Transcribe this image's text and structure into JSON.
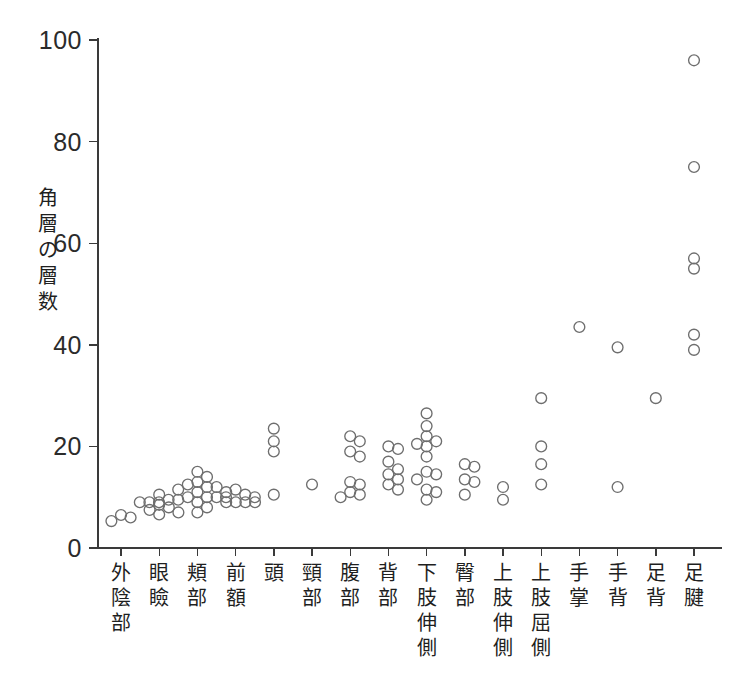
{
  "chart_data": {
    "type": "scatter",
    "title": "",
    "subtitle": "",
    "xlabel": "",
    "ylabel": "角層の層数",
    "ylim": [
      0,
      100
    ],
    "yticks": [
      0,
      20,
      40,
      60,
      80,
      100
    ],
    "grid": false,
    "legend": null,
    "legend_position": "none",
    "marker": "open-circle",
    "marker_color": "#6e6e6e",
    "categories": [
      "外陰部",
      "眼瞼",
      "頬部",
      "前額",
      "頭",
      "頸部",
      "腹部",
      "背部",
      "下肢伸側",
      "臀部",
      "上肢伸側",
      "上肢屈側",
      "手掌",
      "手背",
      "足背",
      "足腱"
    ],
    "series": [
      {
        "name": "角層の層数",
        "groups": [
          {
            "category": "外陰部",
            "values": [
              6.5,
              6.0,
              5.3
            ]
          },
          {
            "category": "眼瞼",
            "values": [
              10.5,
              8.5,
              8.0,
              7.5,
              7.0,
              6.6
            ]
          },
          {
            "category": "頬部",
            "values": [
              15.0,
              14.0,
              13.0,
              12.5,
              12.0,
              12.0,
              11.5,
              11.0,
              11.0,
              10.0,
              10.0,
              10.0,
              9.5,
              9.5,
              9.0,
              9.0,
              9.0,
              9.0,
              9.0,
              9.0,
              9.0,
              9.0,
              8.0,
              7.0
            ]
          },
          {
            "category": "前額",
            "values": [
              11.5,
              10.5,
              10.0,
              10.0
            ]
          },
          {
            "category": "頭",
            "values": [
              23.5,
              21.0,
              19.0,
              10.5
            ]
          },
          {
            "category": "頸部",
            "values": [
              12.5
            ]
          },
          {
            "category": "腹部",
            "values": [
              22.0,
              21.0,
              19.0,
              18.0,
              13.0,
              12.5,
              11.0,
              10.5,
              10.0
            ]
          },
          {
            "category": "背部",
            "values": [
              20.0,
              19.5,
              17.0,
              15.5,
              14.5,
              13.5,
              12.5,
              11.5
            ]
          },
          {
            "category": "下肢伸側",
            "values": [
              26.5,
              24.0,
              22.0,
              21.0,
              20.5,
              20.0,
              18.0,
              15.0,
              14.5,
              13.5,
              11.5,
              11.0,
              9.5
            ]
          },
          {
            "category": "臀部",
            "values": [
              16.5,
              16.0,
              13.5,
              13.0,
              10.5
            ]
          },
          {
            "category": "上肢伸側",
            "values": [
              12.0,
              9.5
            ]
          },
          {
            "category": "上肢屈側",
            "values": [
              29.5,
              20.0,
              16.5,
              12.5
            ]
          },
          {
            "category": "手掌",
            "values": [
              43.5
            ]
          },
          {
            "category": "手背",
            "values": [
              39.5,
              12.0
            ]
          },
          {
            "category": "足背",
            "values": [
              29.5
            ]
          },
          {
            "category": "足腱",
            "values": [
              96.0,
              75.0,
              57.0,
              55.0,
              42.0,
              39.0
            ]
          }
        ]
      }
    ]
  },
  "axes": {
    "y_axis_name": "y-axis",
    "x_axis_name": "x-axis"
  }
}
